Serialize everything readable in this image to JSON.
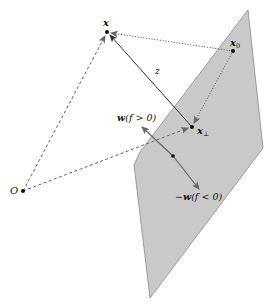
{
  "diagram": {
    "colors": {
      "plane_fill": "#c9c9c9",
      "plane_stroke": "#8a8a8a",
      "solid_line": "#333333",
      "dashed_line": "#666666",
      "dotted_line": "#555555",
      "normal_arrow": "#666666",
      "point": "#111111"
    },
    "points": {
      "x": {
        "label": "x",
        "cx": 107,
        "cy": 32
      },
      "x0": {
        "label": "x",
        "sub": "0",
        "cx": 233,
        "cy": 51
      },
      "x_perp": {
        "label": "x",
        "sub": "⊥",
        "cx": 192,
        "cy": 127
      },
      "origin": {
        "label": "O",
        "cx": 23,
        "cy": 191
      },
      "plane_center": {
        "cx": 173,
        "cy": 156
      }
    },
    "labels": {
      "z": "z",
      "w_pos_bold": "w",
      "w_pos_rest": "(f > 0)",
      "w_neg_minus": "−",
      "w_neg_bold": "w",
      "w_neg_rest": "(f < 0)"
    },
    "plane_polygon": "248,10 263,148 150,298 134,165 140,152"
  }
}
